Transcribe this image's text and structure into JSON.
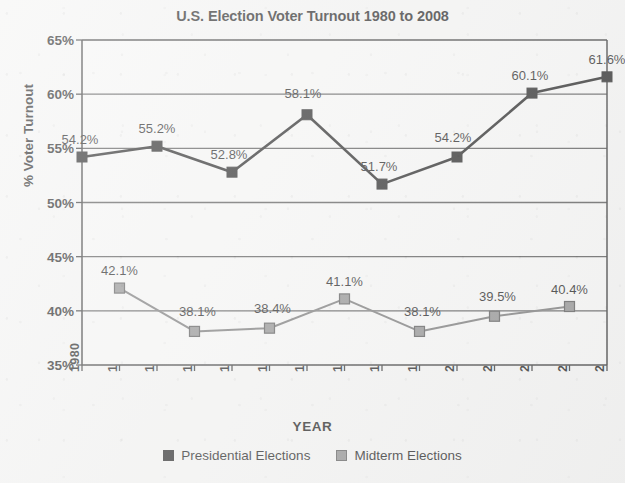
{
  "chart_data": {
    "type": "line",
    "title": "U.S. Election Voter Turnout 1980 to 2008",
    "xlabel": "YEAR",
    "ylabel": "% Voter Turnout",
    "ylim": [
      35,
      65
    ],
    "ytick_labels": [
      "65%",
      "60%",
      "55%",
      "50%",
      "45%",
      "40%",
      "35%"
    ],
    "ytick_values": [
      65,
      60,
      55,
      50,
      45,
      40,
      35
    ],
    "xlim": [
      1980,
      2008
    ],
    "x": [
      1980,
      1982,
      1984,
      1986,
      1988,
      1990,
      1992,
      1994,
      1996,
      1998,
      2000,
      2002,
      2004,
      2006,
      2008
    ],
    "xtick_labels": [
      "1980",
      "1982",
      "1984",
      "1986",
      "1988",
      "1990",
      "1992",
      "1994",
      "1996",
      "1998",
      "2000",
      "2002",
      "2004",
      "2006",
      "2008"
    ],
    "grid": true,
    "legend_position": "bottom",
    "series": [
      {
        "name": "Presidential Elections",
        "color": "#1a1a1a",
        "marker": "square-filled-black",
        "points": [
          {
            "x": 1980,
            "y": 54.2,
            "label": "54.2%"
          },
          {
            "x": 1984,
            "y": 55.2,
            "label": "55.2%"
          },
          {
            "x": 1988,
            "y": 52.8,
            "label": "52.8%"
          },
          {
            "x": 1992,
            "y": 58.1,
            "label": "58.1%"
          },
          {
            "x": 1996,
            "y": 51.7,
            "label": "51.7%"
          },
          {
            "x": 2000,
            "y": 54.2,
            "label": "54.2%"
          },
          {
            "x": 2004,
            "y": 60.1,
            "label": "60.1%"
          },
          {
            "x": 2008,
            "y": 61.6,
            "label": "61.6%"
          }
        ]
      },
      {
        "name": "Midterm Elections",
        "color": "#8a8a8a",
        "marker": "square-filled-gray",
        "points": [
          {
            "x": 1982,
            "y": 42.1,
            "label": "42.1%"
          },
          {
            "x": 1986,
            "y": 38.1,
            "label": "38.1%"
          },
          {
            "x": 1990,
            "y": 38.4,
            "label": "38.4%"
          },
          {
            "x": 1994,
            "y": 41.1,
            "label": "41.1%"
          },
          {
            "x": 1998,
            "y": 38.1,
            "label": "38.1%"
          },
          {
            "x": 2002,
            "y": 39.5,
            "label": "39.5%"
          },
          {
            "x": 2006,
            "y": 40.4,
            "label": "40.4%"
          }
        ]
      }
    ]
  },
  "legend": {
    "entries": [
      {
        "label": "Presidential Elections",
        "swatch": "presidential"
      },
      {
        "label": "Midterm Elections",
        "swatch": "midterm"
      }
    ]
  }
}
